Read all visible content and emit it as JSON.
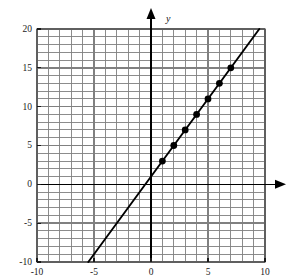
{
  "chart_data": {
    "type": "line",
    "title": "",
    "subtitle": "",
    "xlabel": "",
    "ylabel": "y",
    "x_axis_name": "",
    "y_axis_name": "y",
    "xlim": [
      -10,
      10
    ],
    "ylim": [
      -10,
      20
    ],
    "x_ticks": [
      -10,
      -5,
      0,
      5,
      10
    ],
    "x_tick_labels": [
      "-10",
      "-5",
      "0",
      "5",
      "10"
    ],
    "y_ticks": [
      -10,
      -5,
      0,
      5,
      10,
      15,
      20
    ],
    "y_tick_labels": [
      "-10",
      "-5",
      "0",
      "5",
      "10",
      "15",
      "20"
    ],
    "x_minor_step": 1,
    "y_minor_step": 1,
    "grid": true,
    "grid_color": "#808080",
    "axis_color": "#000000",
    "line_color": "#000000",
    "marker_color": "#000000",
    "legend": "none",
    "equation": "y = 2x + 1",
    "slope": 2,
    "intercept": 1,
    "line_endpoints": [
      {
        "x": -5.5,
        "y": -10
      },
      {
        "x": 9.5,
        "y": 20
      }
    ],
    "series": [
      {
        "name": "y = 2x + 1",
        "marker": "filled-circle",
        "points": [
          {
            "x": 1,
            "y": 3
          },
          {
            "x": 2,
            "y": 5
          },
          {
            "x": 3,
            "y": 7
          },
          {
            "x": 4,
            "y": 9
          },
          {
            "x": 5,
            "y": 11
          },
          {
            "x": 6,
            "y": 13
          },
          {
            "x": 7,
            "y": 15
          }
        ]
      }
    ]
  },
  "labels": {
    "y_axis_letter": "y",
    "x_tick_neg10": "-10",
    "x_tick_neg5": "-5",
    "x_tick_0": "0",
    "x_tick_5": "5",
    "x_tick_10": "10",
    "y_tick_20": "20",
    "y_tick_15": "15",
    "y_tick_10": "10",
    "y_tick_5": "5",
    "y_tick_0": "0",
    "y_tick_neg5": "-5",
    "y_tick_neg10": "-10"
  }
}
